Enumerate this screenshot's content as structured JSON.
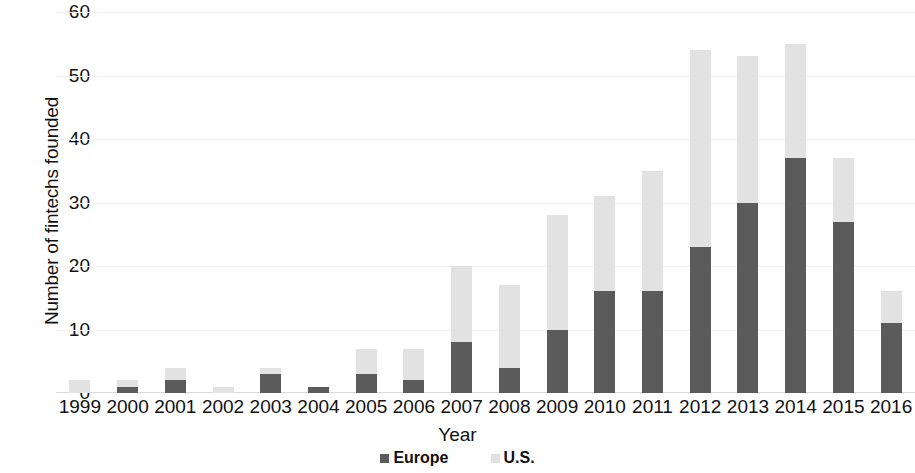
{
  "chart_data": {
    "type": "bar",
    "stacked": true,
    "title": "",
    "subtitle": "",
    "xlabel": "Year",
    "ylabel": "Number of fintechs founded",
    "categories": [
      "1999",
      "2000",
      "2001",
      "2002",
      "2003",
      "2004",
      "2005",
      "2006",
      "2007",
      "2008",
      "2009",
      "2010",
      "2011",
      "2012",
      "2013",
      "2014",
      "2015",
      "2016"
    ],
    "series": [
      {
        "name": "Europe",
        "color": "#5b5b5b",
        "values": [
          0,
          1,
          2,
          0,
          3,
          1,
          3,
          2,
          8,
          4,
          10,
          16,
          16,
          23,
          30,
          37,
          27,
          11
        ]
      },
      {
        "name": "U.S.",
        "color": "#e2e2e2",
        "values": [
          2,
          1,
          2,
          1,
          1,
          0,
          4,
          5,
          12,
          13,
          18,
          15,
          19,
          31,
          23,
          18,
          10,
          5
        ]
      }
    ],
    "totals": [
      2,
      2,
      4,
      1,
      4,
      1,
      7,
      7,
      20,
      17,
      28,
      31,
      35,
      54,
      53,
      55,
      37,
      16
    ],
    "ylim": [
      0,
      60
    ],
    "yticks": [
      "0",
      "10",
      "20",
      "30",
      "40",
      "50",
      "60"
    ],
    "ytick_values": [
      0,
      10,
      20,
      30,
      40,
      50,
      60
    ],
    "grid": true,
    "legend_position": "bottom",
    "legend": [
      {
        "label": "Europe",
        "color": "#5b5b5b",
        "swatch": "square-dark"
      },
      {
        "label": "U.S.",
        "color": "#e2e2e2",
        "swatch": "square-light"
      }
    ]
  },
  "colors": {
    "europe": "#5b5b5b",
    "us": "#e2e2e2",
    "gridline": "#f2f2f2",
    "text": "#111111",
    "background": "#ffffff"
  }
}
